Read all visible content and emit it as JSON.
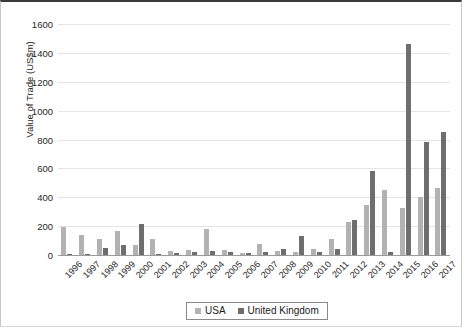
{
  "chart_data": {
    "type": "bar",
    "title": "",
    "xlabel": "",
    "ylabel": "Value of Trade (US$m)",
    "ylim": [
      0,
      1600
    ],
    "ytick_step": 200,
    "yticks": [
      1600,
      1400,
      1200,
      1000,
      800,
      600,
      400,
      200,
      0
    ],
    "grid": true,
    "legend_position": "bottom",
    "categories": [
      "1996",
      "1997",
      "1998",
      "1999",
      "2000",
      "2001",
      "2002",
      "2003",
      "2004",
      "2005",
      "2006",
      "2007",
      "2008",
      "2009",
      "2010",
      "2011",
      "2012",
      "2013",
      "2014",
      "2015",
      "2016",
      "2017"
    ],
    "series": [
      {
        "name": "USA",
        "color": "#b2b2b2",
        "values": [
          195,
          140,
          112,
          168,
          72,
          110,
          30,
          32,
          178,
          38,
          12,
          78,
          26,
          24,
          42,
          108,
          230,
          345,
          452,
          325,
          400,
          465
        ]
      },
      {
        "name": "United Kingdom",
        "color": "#6e6e6e",
        "values": [
          8,
          6,
          48,
          70,
          212,
          10,
          16,
          20,
          28,
          20,
          16,
          24,
          42,
          130,
          24,
          42,
          240,
          580,
          18,
          1460,
          782,
          855
        ]
      }
    ]
  },
  "legend": {
    "items": [
      {
        "label": "USA"
      },
      {
        "label": "United Kingdom"
      }
    ]
  }
}
